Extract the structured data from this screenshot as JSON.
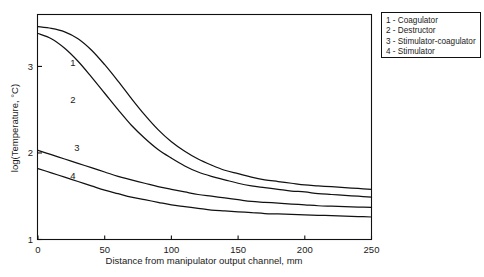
{
  "chart_data": {
    "type": "line",
    "title": "",
    "subtitle": "",
    "xlabel": "Distance from manipulator output channel, mm",
    "ylabel": "log(Temperature, °C)",
    "xlim": [
      0,
      250
    ],
    "ylim": [
      1,
      3.6
    ],
    "xticks": [
      0,
      50,
      100,
      150,
      200,
      250
    ],
    "xtick_labels": [
      "0",
      "50",
      "100",
      "150",
      "200",
      "250"
    ],
    "yticks": [
      1,
      2,
      3
    ],
    "ytick_labels": [
      "1",
      "2",
      "3"
    ],
    "grid": false,
    "legend_position": "top-right-outside",
    "x": [
      0,
      10,
      20,
      30,
      40,
      50,
      60,
      70,
      80,
      90,
      100,
      110,
      120,
      130,
      140,
      150,
      160,
      170,
      180,
      190,
      200,
      210,
      220,
      230,
      240,
      250
    ],
    "series": [
      {
        "name": "1 - Coagulator",
        "label": "1",
        "values": [
          3.46,
          3.44,
          3.4,
          3.32,
          3.19,
          3.02,
          2.83,
          2.63,
          2.44,
          2.27,
          2.13,
          2.02,
          1.93,
          1.86,
          1.8,
          1.76,
          1.72,
          1.69,
          1.67,
          1.65,
          1.63,
          1.62,
          1.61,
          1.6,
          1.59,
          1.58
        ]
      },
      {
        "name": "2 - Destructor",
        "label": "2",
        "values": [
          3.38,
          3.32,
          3.21,
          3.06,
          2.88,
          2.69,
          2.5,
          2.32,
          2.17,
          2.04,
          1.94,
          1.85,
          1.78,
          1.73,
          1.69,
          1.65,
          1.62,
          1.6,
          1.58,
          1.56,
          1.55,
          1.53,
          1.52,
          1.51,
          1.5,
          1.49
        ]
      },
      {
        "name": "3 - Stimulator-coagulator",
        "label": "3",
        "values": [
          2.03,
          1.98,
          1.93,
          1.88,
          1.83,
          1.78,
          1.73,
          1.69,
          1.65,
          1.61,
          1.58,
          1.55,
          1.52,
          1.5,
          1.48,
          1.46,
          1.44,
          1.43,
          1.42,
          1.41,
          1.4,
          1.39,
          1.385,
          1.38,
          1.375,
          1.37
        ]
      },
      {
        "name": "4 - Stimulator",
        "label": "4",
        "values": [
          1.82,
          1.77,
          1.72,
          1.67,
          1.62,
          1.57,
          1.53,
          1.49,
          1.46,
          1.43,
          1.4,
          1.38,
          1.36,
          1.34,
          1.33,
          1.32,
          1.31,
          1.3,
          1.295,
          1.29,
          1.285,
          1.28,
          1.275,
          1.27,
          1.265,
          1.26
        ]
      }
    ],
    "curve_labels": [
      {
        "text": "1",
        "x": 73,
        "y": 66
      },
      {
        "text": "2",
        "x": 73,
        "y": 103
      },
      {
        "text": "3",
        "x": 77,
        "y": 151
      },
      {
        "text": "4",
        "x": 73,
        "y": 179
      }
    ]
  },
  "legend": {
    "entries": [
      "1 - Coagulator",
      "2 - Destructor",
      "3 - Stimulator-coagulator",
      "4 - Stimulator"
    ]
  },
  "colors": {
    "line": "#111111",
    "axis": "#111111",
    "background": "#ffffff",
    "text": "#1a1a1a"
  }
}
